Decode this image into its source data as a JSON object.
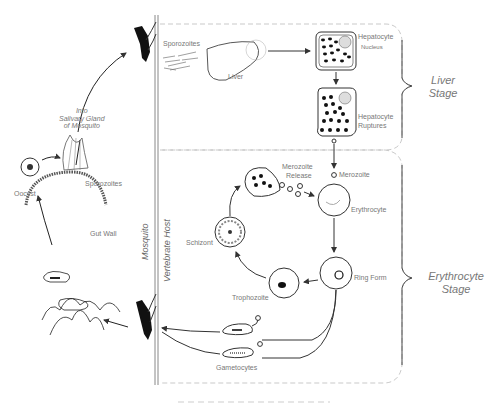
{
  "diagram": {
    "hosts": {
      "mosquito": "Mosquito",
      "vertebrate": "Vertebrate  Host"
    },
    "mosquito_stage": {
      "salivary": "Into\nSalivary Gland\nof Mosquito",
      "oocyst": "Oocyst",
      "sporozoites": "Sporozoites",
      "gut_wall": "Gut Wall"
    },
    "liver_stage": {
      "label_line1": "Liver",
      "label_line2": "Stage",
      "sporozoites": "Sporozoites",
      "liver": "Liver",
      "hepatocyte": "Hepatocyte",
      "nucleus": "Nucleus",
      "hepatocyte_ruptures_1": "Hepatocyte",
      "hepatocyte_ruptures_2": "Ruptures"
    },
    "erythrocyte_stage": {
      "label_line1": "Erythrocyte",
      "label_line2": "Stage",
      "merozoite_release_1": "Merozoite",
      "merozoite_release_2": "Release",
      "merozoite": "Merozoite",
      "erythrocyte": "Erythrocyte",
      "ring_form": "Ring Form",
      "trophozoite": "Trophozoite",
      "schizont": "Schizont",
      "gametocytes": "Gametocytes"
    },
    "colors": {
      "line": "#333333",
      "text": "#777777",
      "dashed": "#bbbbbb"
    }
  }
}
